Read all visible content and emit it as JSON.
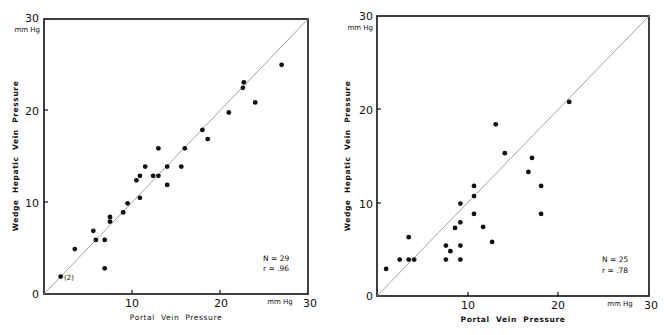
{
  "chart_data": [
    {
      "type": "scatter",
      "panel": "left",
      "title": "",
      "xlabel": "Portal Vein Pressure",
      "ylabel": "Wedge Hepatic Vein Pressure",
      "x_unit": "mm Hg",
      "y_unit": "mm Hg",
      "xlim": [
        0,
        30
      ],
      "ylim": [
        0,
        30
      ],
      "x_ticks": [
        0,
        10,
        20,
        30
      ],
      "y_ticks": [
        0,
        10,
        20,
        30
      ],
      "grid": false,
      "identity_line": true,
      "annotations": [
        {
          "text": "(2)",
          "x": 1.9,
          "y": 1.9
        }
      ],
      "stats": {
        "n_label": "N = 29",
        "r_label": "r = .96"
      },
      "points": [
        [
          1.9,
          1.9
        ],
        [
          3.5,
          4.9
        ],
        [
          5.6,
          6.9
        ],
        [
          5.9,
          5.9
        ],
        [
          6.9,
          5.9
        ],
        [
          6.9,
          2.8
        ],
        [
          7.5,
          8.4
        ],
        [
          7.5,
          7.9
        ],
        [
          9.0,
          8.9
        ],
        [
          9.5,
          9.9
        ],
        [
          10.9,
          10.5
        ],
        [
          10.5,
          12.4
        ],
        [
          10.9,
          12.9
        ],
        [
          11.5,
          13.9
        ],
        [
          12.4,
          12.9
        ],
        [
          13.0,
          12.9
        ],
        [
          13.0,
          15.9
        ],
        [
          14.0,
          11.9
        ],
        [
          14.0,
          13.9
        ],
        [
          15.6,
          13.9
        ],
        [
          16.0,
          15.9
        ],
        [
          18.0,
          17.9
        ],
        [
          18.6,
          16.9
        ],
        [
          21.0,
          19.8
        ],
        [
          22.6,
          22.5
        ],
        [
          22.7,
          23.1
        ],
        [
          24.0,
          20.9
        ],
        [
          27.0,
          25.0
        ]
      ]
    },
    {
      "type": "scatter",
      "panel": "right",
      "title": "",
      "xlabel": "Portal Vein Pressure",
      "ylabel": "Wedge Hepatic Vein Pressure",
      "x_unit": "mm Hg",
      "y_unit": "mm Hg",
      "xlim": [
        0,
        30
      ],
      "ylim": [
        0,
        30
      ],
      "x_ticks": [
        0,
        10,
        20,
        30
      ],
      "y_ticks": [
        0,
        10,
        20,
        30
      ],
      "grid": false,
      "identity_line": true,
      "annotations": [],
      "stats": {
        "n_label": "N = 25",
        "r_label": "r = .78"
      },
      "points": [
        [
          1.0,
          2.9
        ],
        [
          2.5,
          3.9
        ],
        [
          3.5,
          3.9
        ],
        [
          4.1,
          3.9
        ],
        [
          3.5,
          6.3
        ],
        [
          7.6,
          3.9
        ],
        [
          7.6,
          5.4
        ],
        [
          8.1,
          4.8
        ],
        [
          8.6,
          7.3
        ],
        [
          9.2,
          3.9
        ],
        [
          9.2,
          5.4
        ],
        [
          9.2,
          7.9
        ],
        [
          9.2,
          9.9
        ],
        [
          10.7,
          8.8
        ],
        [
          10.7,
          10.7
        ],
        [
          10.7,
          11.8
        ],
        [
          11.7,
          7.4
        ],
        [
          12.7,
          5.8
        ],
        [
          13.1,
          18.4
        ],
        [
          14.1,
          15.3
        ],
        [
          16.7,
          13.3
        ],
        [
          17.1,
          14.8
        ],
        [
          18.1,
          11.8
        ],
        [
          18.1,
          8.8
        ],
        [
          21.2,
          20.8
        ]
      ]
    }
  ],
  "labels": {
    "left": {
      "y_top_tick": "30",
      "y_unit": "mm Hg",
      "y_tick_20": "20",
      "y_tick_10": "10",
      "y_tick_0": "0",
      "x_tick_10": "10",
      "x_tick_20": "20",
      "x_tick_30": "30",
      "x_unit": "mm Hg",
      "xlabel": "Portal  Vein  Pressure",
      "ylabel": "Wedge  Hepatic  Vein  Pressure",
      "n": "N = 29",
      "r": "r = .96",
      "annot": "(2)"
    },
    "right": {
      "y_top_tick": "30",
      "y_unit": "mm Hg",
      "y_tick_20": "20",
      "y_tick_10": "10",
      "y_tick_0": "0",
      "x_tick_10": "10",
      "x_tick_20": "20",
      "x_tick_30": "30",
      "x_unit": "mm Hg",
      "xlabel": "Portal  Vein  Pressure",
      "ylabel": "Wedge  Hepatic  Vein  Pressure",
      "n": "N = 25",
      "r": "r = .78"
    }
  }
}
